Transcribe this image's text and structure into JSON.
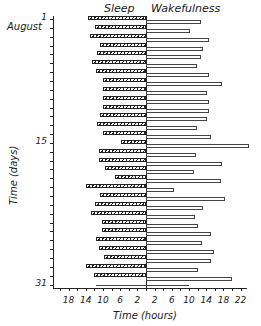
{
  "chart_data": {
    "type": "bar",
    "orientation": "horizontal-diverging",
    "title": "",
    "headers": {
      "left": "Sleep",
      "right": "Wakefulness"
    },
    "ylabel": "Time (days)",
    "xlabel": "Time (hours)",
    "month_label": "August",
    "y_tick_labels": [
      "1",
      "15",
      "31"
    ],
    "x_tick_labels_left": [
      "18",
      "14",
      "10",
      "6",
      "2"
    ],
    "x_tick_labels_right": [
      "2",
      "6",
      "10",
      "14",
      "18",
      "22"
    ],
    "xlim_left": 21,
    "xlim_right": 23,
    "grid": false,
    "categories": [
      "1",
      "2",
      "3",
      "4",
      "5",
      "6",
      "7",
      "8",
      "9",
      "10",
      "11",
      "12",
      "13",
      "14",
      "15",
      "16",
      "17",
      "18",
      "19",
      "20",
      "21",
      "22",
      "23",
      "24",
      "25",
      "26",
      "27",
      "28",
      "29",
      "30",
      "31"
    ],
    "series": [
      {
        "name": "Sleep",
        "style": "hatched",
        "values": [
          13.5,
          11.9,
          13.0,
          10.7,
          11.4,
          12.6,
          11.6,
          10.0,
          10.0,
          10.0,
          10.0,
          10.7,
          11.4,
          10.0,
          5.8,
          10.9,
          10.9,
          9.5,
          7.2,
          14.0,
          10.7,
          11.9,
          12.8,
          10.2,
          10.2,
          11.6,
          10.9,
          9.8,
          14.0,
          12.1,
          11.6
        ]
      },
      {
        "name": "Wakefulness",
        "style": "open",
        "values": [
          12.8,
          10.2,
          14.6,
          13.3,
          12.8,
          11.9,
          14.6,
          17.7,
          14.2,
          14.6,
          14.6,
          14.2,
          11.9,
          15.1,
          24.0,
          11.6,
          17.7,
          11.2,
          17.4,
          6.5,
          18.4,
          13.3,
          11.4,
          12.1,
          15.1,
          13.0,
          15.8,
          15.1,
          12.1,
          20.0,
          10.0
        ]
      }
    ]
  }
}
